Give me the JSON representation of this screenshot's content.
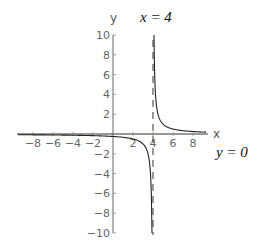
{
  "chart_data": {
    "type": "line",
    "title": "",
    "function": "y = 1/(x - 4)",
    "xlabel": "x",
    "ylabel": "y",
    "xlim": [
      -9.5,
      9.5
    ],
    "ylim": [
      -10,
      10
    ],
    "x_ticks": [
      -8,
      -6,
      -4,
      -2,
      2,
      4,
      6,
      8
    ],
    "y_ticks": [
      -10,
      -8,
      -6,
      -4,
      -2,
      2,
      4,
      6,
      8,
      10
    ],
    "grid": false,
    "series": [
      {
        "name": "left branch",
        "x": [
          -9.5,
          -8,
          -6,
          -4,
          -2,
          0,
          2,
          3,
          3.5,
          3.8,
          3.9
        ],
        "y": [
          -0.07,
          -0.08,
          -0.1,
          -0.13,
          -0.17,
          -0.25,
          -0.5,
          -1,
          -2,
          -5,
          -10
        ]
      },
      {
        "name": "right branch",
        "x": [
          4.1,
          4.2,
          4.5,
          5,
          6,
          7,
          8,
          9
        ],
        "y": [
          10,
          5,
          2,
          1,
          0.5,
          0.33,
          0.25,
          0.2
        ]
      }
    ],
    "asymptotes": [
      {
        "type": "vertical",
        "value": 4,
        "label": "x = 4",
        "style": "dashed"
      },
      {
        "type": "horizontal",
        "value": 0,
        "label": "y = 0"
      }
    ],
    "annotations": [
      "x = 4",
      "y = 0"
    ]
  },
  "labels": {
    "x_axis": "x",
    "y_axis": "y",
    "vertical_asymptote": "x = 4",
    "horizontal_asymptote": "y = 0"
  }
}
